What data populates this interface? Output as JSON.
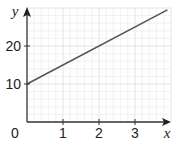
{
  "chart_data": {
    "type": "line",
    "title": "",
    "xlabel": "x",
    "ylabel": "y",
    "xlim": [
      0,
      4.0
    ],
    "ylim": [
      0,
      30
    ],
    "x_ticks": [
      0,
      1,
      2,
      3
    ],
    "y_ticks": [
      10,
      20
    ],
    "origin_label": "0",
    "grid": true,
    "legend": null,
    "series": [
      {
        "name": "y = 5x + 10",
        "x": [
          0,
          1,
          2,
          3,
          3.9
        ],
        "values": [
          10,
          15,
          20,
          25,
          29.5
        ],
        "color": "#555555"
      }
    ]
  },
  "labels": {
    "x_axis": "x",
    "y_axis": "y",
    "origin": "0",
    "x1": "1",
    "x2": "2",
    "x3": "3",
    "y10": "10",
    "y20": "20"
  },
  "colors": {
    "axis": "#333333",
    "line": "#555555",
    "grid_minor": "#eeeeee",
    "grid_major": "#dddddd"
  }
}
